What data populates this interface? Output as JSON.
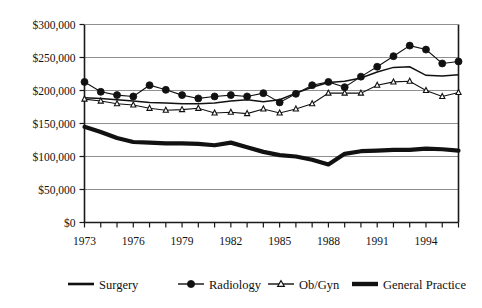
{
  "chart_data": {
    "type": "line",
    "title": "",
    "subtitle": "",
    "xlabel": "",
    "ylabel": "",
    "grid": "horizontal",
    "legend_position": "bottom",
    "xlim": [
      1973,
      1996
    ],
    "ylim": [
      0,
      300000
    ],
    "x": [
      1973,
      1974,
      1975,
      1976,
      1977,
      1978,
      1979,
      1980,
      1981,
      1982,
      1983,
      1984,
      1985,
      1986,
      1987,
      1988,
      1989,
      1990,
      1991,
      1992,
      1993,
      1994,
      1995,
      1996
    ],
    "x_tick_labels": [
      "1973",
      "1976",
      "1979",
      "1982",
      "1985",
      "1988",
      "1991",
      "1994"
    ],
    "x_tick_values": [
      1973,
      1976,
      1979,
      1982,
      1985,
      1988,
      1991,
      1994
    ],
    "y_tick_labels": [
      "$300,000",
      "$250,000",
      "$200,000",
      "$150,000",
      "$100,000",
      "$50,000",
      "$0"
    ],
    "y_tick_values": [
      300000,
      250000,
      200000,
      150000,
      100000,
      50000,
      0
    ],
    "series": [
      {
        "name": "Surgery",
        "marker": "none",
        "line": "thin",
        "values": [
          189000,
          188000,
          186000,
          184000,
          182000,
          181000,
          180000,
          180000,
          181000,
          184000,
          186000,
          183000,
          186000,
          196000,
          205000,
          212000,
          214000,
          219000,
          228000,
          235000,
          236000,
          223000,
          222000,
          224000
        ]
      },
      {
        "name": "Radiology",
        "marker": "filled-circle",
        "line": "thin",
        "values": [
          213000,
          198000,
          193000,
          191000,
          208000,
          201000,
          193000,
          188000,
          191000,
          193000,
          191000,
          196000,
          182000,
          195000,
          208000,
          213000,
          205000,
          221000,
          236000,
          252000,
          268000,
          262000,
          241000,
          244000
        ]
      },
      {
        "name": "Ob/Gyn",
        "marker": "open-triangle",
        "line": "thin",
        "values": [
          187000,
          184000,
          180000,
          178000,
          173000,
          170000,
          171000,
          173000,
          166000,
          167000,
          165000,
          172000,
          166000,
          172000,
          180000,
          196000,
          196000,
          196000,
          208000,
          213000,
          214000,
          200000,
          191000,
          197000
        ]
      },
      {
        "name": "General Practice",
        "marker": "none",
        "line": "thick",
        "values": [
          145000,
          137000,
          128000,
          122000,
          121000,
          120000,
          120000,
          119000,
          117000,
          121000,
          114000,
          107000,
          102000,
          100000,
          95000,
          88000,
          104000,
          108000,
          109000,
          110000,
          110000,
          112000,
          111000,
          109000
        ]
      }
    ]
  },
  "legend": {
    "items": [
      {
        "label": "Surgery",
        "marker": "line-thin"
      },
      {
        "label": "Radiology",
        "marker": "line-dot"
      },
      {
        "label": "Ob/Gyn",
        "marker": "line-triangle"
      },
      {
        "label": "General Practice",
        "marker": "line-thick"
      }
    ]
  },
  "colors": {
    "ink": "#111111",
    "grid": "#8f8f8f",
    "background": "#ffffff"
  }
}
